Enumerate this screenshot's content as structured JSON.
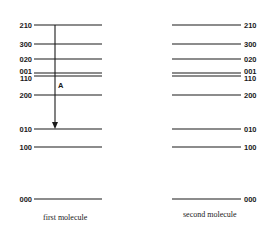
{
  "diagram": {
    "title": "",
    "molecules": [
      {
        "caption": "first molecule",
        "label_side": "left",
        "levels": [
          {
            "label": "210",
            "y": 25
          },
          {
            "label": "300",
            "y": 44
          },
          {
            "label": "020",
            "y": 59
          },
          {
            "label": "001",
            "y": 73
          },
          {
            "label": "110",
            "y": 76
          },
          {
            "label": "200",
            "y": 95
          },
          {
            "label": "010",
            "y": 129
          },
          {
            "label": "100",
            "y": 147
          },
          {
            "label": "000",
            "y": 199
          }
        ]
      },
      {
        "caption": "second molecule",
        "label_side": "right",
        "levels": [
          {
            "label": "210",
            "y": 25
          },
          {
            "label": "300",
            "y": 44
          },
          {
            "label": "020",
            "y": 59
          },
          {
            "label": "001",
            "y": 73
          },
          {
            "label": "110",
            "y": 76
          },
          {
            "label": "200",
            "y": 95
          },
          {
            "label": "010",
            "y": 129
          },
          {
            "label": "100",
            "y": 147
          },
          {
            "label": "000",
            "y": 199
          }
        ]
      }
    ],
    "transition": {
      "label": "A",
      "from": "210",
      "to": "010",
      "molecule": "first molecule",
      "direction": "down"
    }
  }
}
